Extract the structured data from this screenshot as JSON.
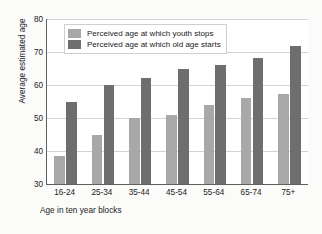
{
  "chart_data": {
    "type": "bar",
    "title": "",
    "subtitle": "",
    "xlabel": "Age in ten year blocks",
    "ylabel": "Average estimated age",
    "categories": [
      "16-24",
      "25-34",
      "35-44",
      "45-54",
      "55-64",
      "65-74",
      "75+"
    ],
    "series": [
      {
        "name": "Perceived age at which youth stops",
        "color": "#a8a8a8",
        "values": [
          38.5,
          45,
          50,
          51,
          54,
          56,
          57.3
        ]
      },
      {
        "name": "Perceived age at which old age starts",
        "color": "#6e6e6e",
        "values": [
          55,
          60,
          62,
          65,
          66,
          68.2,
          71.7
        ]
      }
    ],
    "ylim": [
      30,
      80
    ],
    "yticks": [
      30,
      40,
      50,
      60,
      70,
      80
    ],
    "ytick_labels": [
      "30",
      "40",
      "50",
      "60",
      "70",
      "80"
    ],
    "grid": true,
    "grid_axis": "y",
    "legend_position": "top-left-inside",
    "background": "#ffffff",
    "figure_background": "#fbfbfa",
    "axis_color": "#5f5f5f",
    "grid_color": "#d3d3d3"
  }
}
